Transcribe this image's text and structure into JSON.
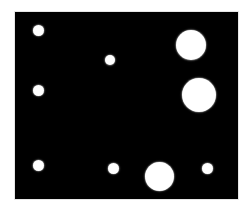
{
  "image": {
    "width": 252,
    "height": 210,
    "background": "#ffffff",
    "panel": {
      "x": 15,
      "y": 12,
      "width": 223,
      "height": 187,
      "color": "#000000",
      "border_color": "#e6e6e6"
    },
    "dot_color": "#ffffff",
    "dots": [
      {
        "cx": 38,
        "cy": 30,
        "r": 5.5
      },
      {
        "cx": 110,
        "cy": 60,
        "r": 5
      },
      {
        "cx": 191,
        "cy": 45,
        "r": 15
      },
      {
        "cx": 38,
        "cy": 90,
        "r": 5.5
      },
      {
        "cx": 199,
        "cy": 95,
        "r": 17
      },
      {
        "cx": 38,
        "cy": 165,
        "r": 5.5
      },
      {
        "cx": 113,
        "cy": 168,
        "r": 5.5
      },
      {
        "cx": 159,
        "cy": 176,
        "r": 14.5
      },
      {
        "cx": 207,
        "cy": 168,
        "r": 5.5
      }
    ]
  }
}
